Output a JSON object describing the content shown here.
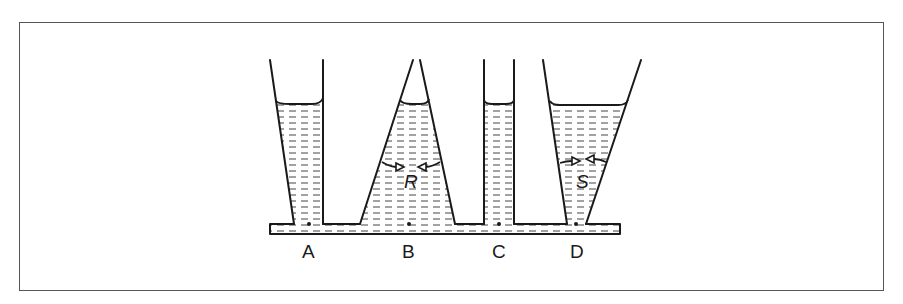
{
  "diagram": {
    "title": "",
    "vessels": [
      {
        "id": "A",
        "label": "A",
        "shape": "tapering-narrow-bottom-left-slant"
      },
      {
        "id": "B",
        "label": "B",
        "shape": "conical-wide-bottom",
        "region_label": "R"
      },
      {
        "id": "C",
        "label": "C",
        "shape": "straight-narrow-tube"
      },
      {
        "id": "D",
        "label": "D",
        "shape": "funnel-wide-top",
        "region_label": "S"
      }
    ],
    "labels": {
      "a": "A",
      "b": "B",
      "c": "C",
      "d": "D",
      "r": "R",
      "s": "S"
    },
    "colors": {
      "line": "#1a1a1a",
      "frame": "#555555",
      "background": "#ffffff"
    }
  }
}
